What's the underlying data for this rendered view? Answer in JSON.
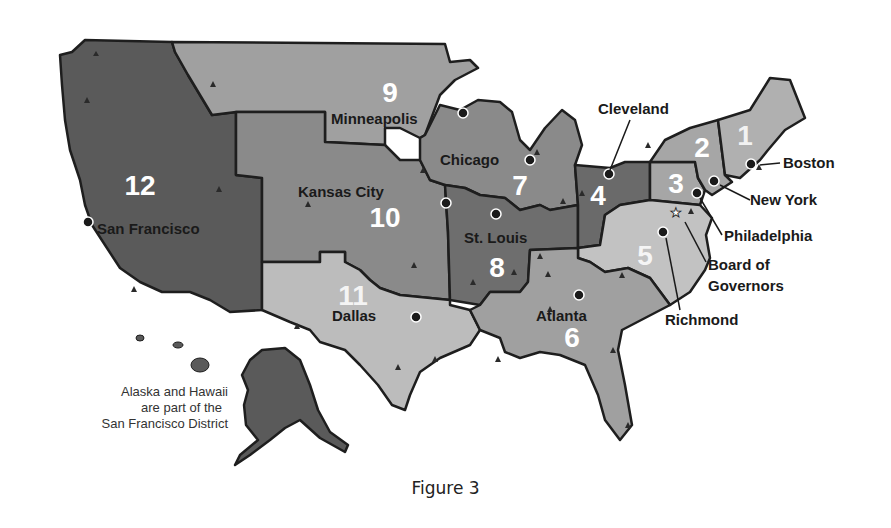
{
  "map": {
    "type": "district map",
    "subject": "Federal Reserve Districts",
    "districts": [
      {
        "number": "1",
        "city": "Boston"
      },
      {
        "number": "2",
        "city": "New York"
      },
      {
        "number": "3",
        "city": "Philadelphia"
      },
      {
        "number": "4",
        "city": "Cleveland"
      },
      {
        "number": "5",
        "city": "Richmond"
      },
      {
        "number": "6",
        "city": "Atlanta"
      },
      {
        "number": "7",
        "city": "Chicago"
      },
      {
        "number": "8",
        "city": "St. Louis"
      },
      {
        "number": "9",
        "city": "Minneapolis"
      },
      {
        "number": "10",
        "city": "Kansas City"
      },
      {
        "number": "11",
        "city": "Dallas"
      },
      {
        "number": "12",
        "city": "San Francisco"
      }
    ],
    "special_labels": {
      "board": [
        "Board of",
        "Governors"
      ]
    },
    "note": [
      "Alaska and Hawaii",
      "are part of the",
      "San Francisco District"
    ],
    "colors": {
      "dark": "#555555",
      "medium_dark": "#6e6e6e",
      "medium": "#8c8c8c",
      "light": "#a8a8a8",
      "lighter": "#bdbdbd",
      "border": "#1e1e1e"
    }
  },
  "caption": "Figure 3"
}
